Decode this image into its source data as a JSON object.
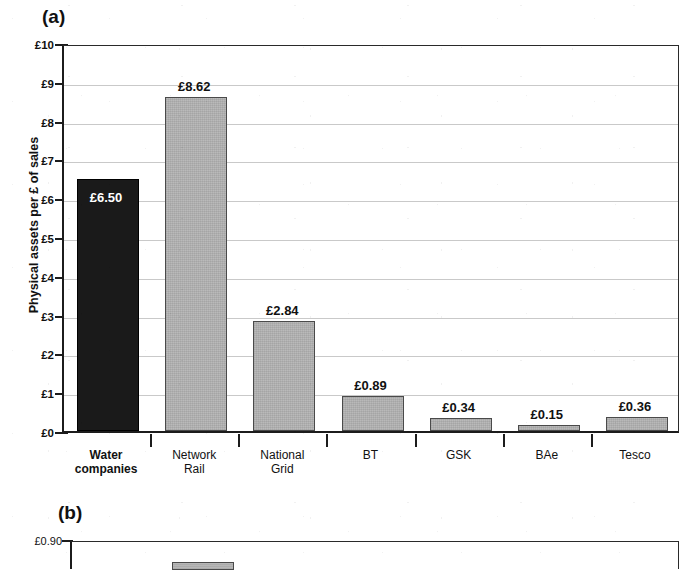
{
  "figure": {
    "panel_a_letter": "(a)",
    "panel_b_letter": "(b)"
  },
  "chart_data": [
    {
      "type": "bar",
      "panel": "(a)",
      "title": "",
      "xlabel": "",
      "ylabel": "Physical assets per £ of sales",
      "ylim": [
        0,
        10
      ],
      "ytick_labels": [
        "£0",
        "£1",
        "£2",
        "£3",
        "£4",
        "£5",
        "£6",
        "£7",
        "£8",
        "£9",
        "£10"
      ],
      "ytick_values": [
        0,
        1,
        2,
        3,
        4,
        5,
        6,
        7,
        8,
        9,
        10
      ],
      "grid": true,
      "legend": "none",
      "categories": [
        "Water companies",
        "Network Rail",
        "National Grid",
        "BT",
        "GSK",
        "BAe",
        "Tesco"
      ],
      "category_lines": [
        [
          "Water",
          "companies"
        ],
        [
          "Network",
          "Rail"
        ],
        [
          "National",
          "Grid"
        ],
        [
          "BT"
        ],
        [
          "GSK"
        ],
        [
          "BAe"
        ],
        [
          "Tesco"
        ]
      ],
      "values": [
        6.5,
        8.62,
        2.84,
        0.89,
        0.34,
        0.15,
        0.36
      ],
      "data_labels": [
        "£6.50",
        "£8.62",
        "£2.84",
        "£0.89",
        "£0.34",
        "£0.15",
        "£0.36"
      ],
      "label_position": [
        "inside",
        "above",
        "above",
        "above",
        "above",
        "above",
        "above"
      ],
      "bar_colors": [
        "#1a1a1a",
        "#b3b3b3",
        "#b3b3b3",
        "#b3b3b3",
        "#b3b3b3",
        "#b3b3b3",
        "#b3b3b3"
      ],
      "highlight_category": "Water companies"
    },
    {
      "type": "bar",
      "panel": "(b)",
      "note": "cropped at bottom edge of image",
      "ytick_labels": [
        "£0.90"
      ],
      "ytick_values": [
        0.9
      ],
      "ylim": [
        null,
        0.9
      ],
      "categories": [],
      "values": []
    }
  ],
  "colors": {
    "bar_gray": "#b3b3b3",
    "bar_dark": "#1a1a1a",
    "axis": "#1c1c1c",
    "gridline": "#c9c9c9",
    "text": "#111111",
    "inside_label": "#ffffff",
    "background": "#ffffff"
  }
}
